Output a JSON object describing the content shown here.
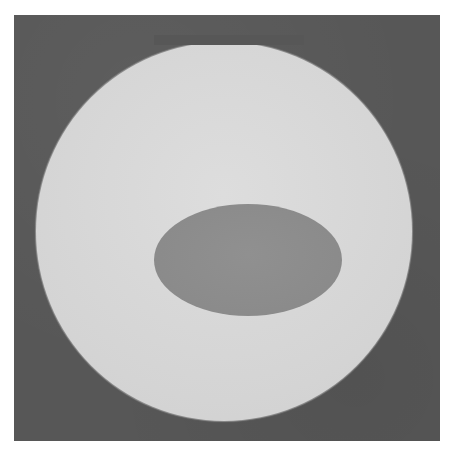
{
  "image": {
    "description": "Grayscale photograph of a bright circular disk on a dark square background with a darker elliptical region in the center",
    "colors": {
      "page_background": "#ffffff",
      "frame_background": "#575757",
      "disk": "#d6d6d6",
      "ellipse": "#8c8c8c"
    },
    "shapes": [
      {
        "type": "square",
        "name": "dark-background",
        "x": 14,
        "y": 15,
        "width": 426,
        "height": 426
      },
      {
        "type": "circle",
        "name": "bright-disk",
        "cx": 224,
        "cy": 231,
        "rx": 188,
        "ry": 189
      },
      {
        "type": "ellipse",
        "name": "dark-ellipse",
        "cx": 226,
        "cy": 233,
        "rx": 94,
        "ry": 56
      }
    ]
  }
}
